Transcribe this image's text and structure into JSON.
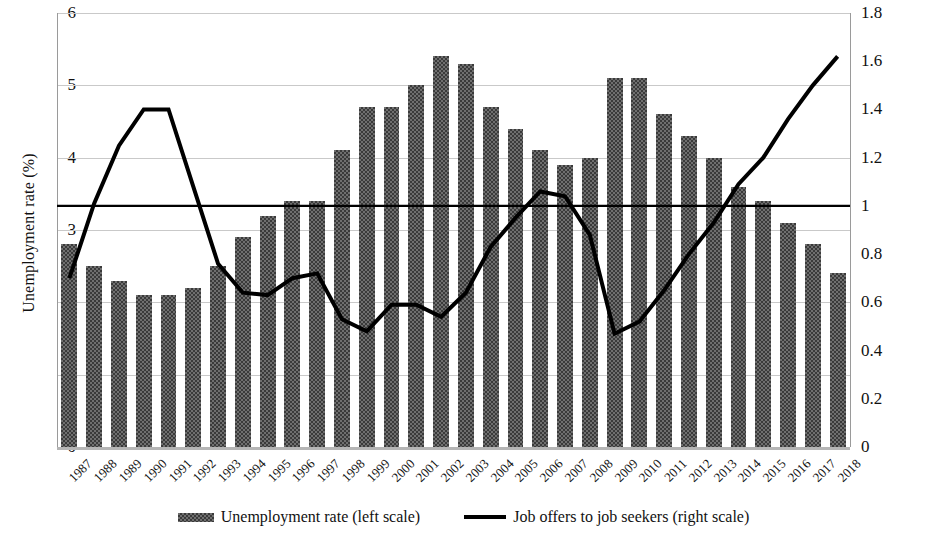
{
  "chart_data": {
    "type": "bar",
    "title": "",
    "subtitle": "",
    "xlabel": "",
    "ylabel": "Unemployment rate (%)",
    "y2label": "Ratio of job opening to job applicants",
    "grid": true,
    "legend_position": "bottom",
    "ylim": [
      0,
      6
    ],
    "y2lim": [
      0,
      1.8
    ],
    "yticks": [
      "0",
      "1",
      "2",
      "3",
      "4",
      "5",
      "6"
    ],
    "y2ticks": [
      "0",
      "0.2",
      "0.4",
      "0.6",
      "0.8",
      "1",
      "1.2",
      "1.4",
      "1.6",
      "1.8"
    ],
    "categories": [
      "1987",
      "1988",
      "1989",
      "1990",
      "1991",
      "1992",
      "1993",
      "1994",
      "1995",
      "1996",
      "1997",
      "1998",
      "1999",
      "2000",
      "2001",
      "2002",
      "2003",
      "2004",
      "2005",
      "2006",
      "2007",
      "2008",
      "2009",
      "2010",
      "2011",
      "2012",
      "2013",
      "2014",
      "2015",
      "2016",
      "2017",
      "2018"
    ],
    "series": [
      {
        "name": "Unemployment rate (left scale)",
        "type": "bar",
        "axis": "left",
        "unit": "%",
        "values": [
          2.8,
          2.5,
          2.3,
          2.1,
          2.1,
          2.2,
          2.5,
          2.9,
          3.2,
          3.4,
          3.4,
          4.1,
          4.7,
          4.7,
          5.0,
          5.4,
          5.3,
          4.7,
          4.4,
          4.1,
          3.9,
          4.0,
          5.1,
          5.1,
          4.6,
          4.3,
          4.0,
          3.6,
          3.4,
          3.1,
          2.8,
          2.4
        ]
      },
      {
        "name": "Job offers to job seekers (right scale)",
        "type": "line",
        "axis": "right",
        "unit": "ratio",
        "values": [
          0.7,
          1.01,
          1.25,
          1.4,
          1.4,
          1.08,
          0.76,
          0.64,
          0.63,
          0.7,
          0.72,
          0.53,
          0.48,
          0.59,
          0.59,
          0.54,
          0.64,
          0.83,
          0.95,
          1.06,
          1.04,
          0.88,
          0.47,
          0.52,
          0.65,
          0.8,
          0.93,
          1.09,
          1.2,
          1.36,
          1.5,
          1.62
        ]
      }
    ],
    "reference_line": {
      "value": 1.0,
      "axis": "right",
      "label": ""
    }
  },
  "legend": {
    "items": [
      {
        "label": "Unemployment rate (left scale)",
        "marker": "bar-swatch"
      },
      {
        "label": "Job offers to job seekers (right scale)",
        "marker": "line-swatch"
      }
    ]
  },
  "colors": {
    "bar_fill": "#6f6f6f",
    "bar_hatch": "#3a3a3a",
    "line": "#000000",
    "grid": "#c9c9c9",
    "baseline": "#b5b5b5",
    "text": "#111111"
  }
}
